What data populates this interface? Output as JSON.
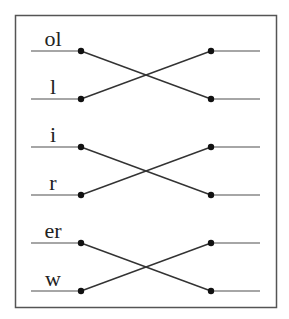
{
  "diagram": {
    "type": "crossing-pairs",
    "colors": {
      "frame": "#555555",
      "stub": "#888888",
      "cross": "#333333",
      "dot": "#111111"
    },
    "pairs": [
      {
        "top_label": "ol",
        "bottom_label": "l",
        "connection": "cross"
      },
      {
        "top_label": "i",
        "bottom_label": "r",
        "connection": "cross"
      },
      {
        "top_label": "er",
        "bottom_label": "w",
        "connection": "cross"
      }
    ]
  }
}
